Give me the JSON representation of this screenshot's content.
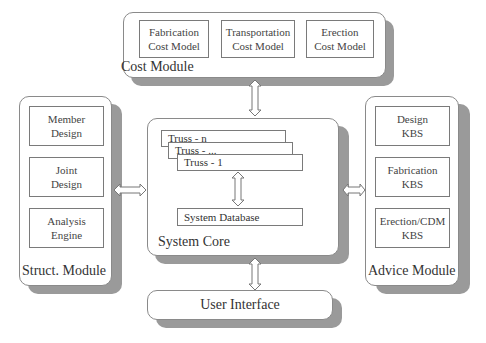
{
  "cost_module": {
    "label": "Cost Module",
    "boxes": [
      {
        "line1": "Fabrication",
        "line2": "Cost Model"
      },
      {
        "line1": "Transportation",
        "line2": "Cost Model"
      },
      {
        "line1": "Erection",
        "line2": "Cost Model"
      }
    ]
  },
  "struct_module": {
    "label": "Struct. Module",
    "boxes": [
      {
        "line1": "Member",
        "line2": "Design"
      },
      {
        "line1": "Joint",
        "line2": "Design"
      },
      {
        "line1": "Analysis",
        "line2": "Engine"
      }
    ]
  },
  "system_core": {
    "label": "System Core",
    "trusses": [
      "Truss - n",
      "Truss - ...",
      "Truss - 1"
    ],
    "database": "System Database"
  },
  "advice_module": {
    "label": "Advice Module",
    "boxes": [
      {
        "line1": "Design",
        "line2": "KBS"
      },
      {
        "line1": "Fabrication",
        "line2": "KBS"
      },
      {
        "line1": "Erection/CDM",
        "line2": "KBS"
      }
    ]
  },
  "user_interface": {
    "label": "User Interface"
  },
  "colors": {
    "shadow": "#9a9a9a",
    "border": "#8a8a8a",
    "background": "#ffffff"
  }
}
